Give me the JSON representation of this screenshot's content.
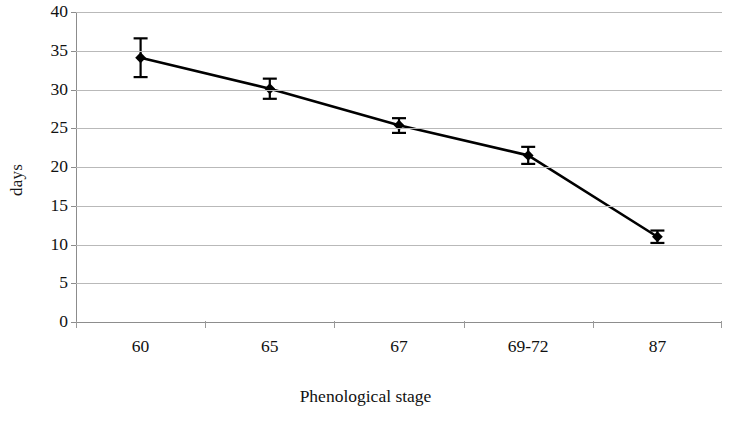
{
  "chart_data": {
    "type": "line",
    "title": "",
    "subtitle": "",
    "xlabel": "Phenological stage",
    "ylabel": "days",
    "categories": [
      "60",
      "65",
      "67",
      "69-72",
      "87"
    ],
    "values": [
      34.1,
      30.1,
      25.4,
      21.5,
      11.0
    ],
    "error_low": [
      31.6,
      28.8,
      24.4,
      20.4,
      10.2
    ],
    "error_high": [
      36.6,
      31.4,
      26.3,
      22.6,
      11.8
    ],
    "error_minus": [
      2.5,
      1.3,
      1.0,
      1.1,
      0.8
    ],
    "error_plus": [
      2.5,
      1.3,
      0.9,
      1.1,
      0.8
    ],
    "series": [
      {
        "name": "days",
        "values": [
          34.1,
          30.1,
          25.4,
          21.5,
          11.0
        ],
        "marker": "diamond",
        "color": "#000000",
        "error_bars": true
      }
    ],
    "ylim": [
      0,
      40
    ],
    "ytick_values": [
      0,
      5,
      10,
      15,
      20,
      25,
      30,
      35,
      40
    ],
    "ytick_labels": [
      "0",
      "5",
      "10",
      "15",
      "20",
      "25",
      "30",
      "35",
      "40"
    ],
    "grid": {
      "horizontal": true,
      "vertical": false,
      "color": "#b9b9b9"
    },
    "legend": {
      "visible": false,
      "position": "none",
      "entries": []
    },
    "annotations": [],
    "colors": {
      "line": "#000000",
      "marker": "#000000",
      "error_bar": "#000000",
      "gridline": "#b9b9b9",
      "axis": "#8c8c8c",
      "text": "#111111",
      "background": "#ffffff"
    }
  }
}
